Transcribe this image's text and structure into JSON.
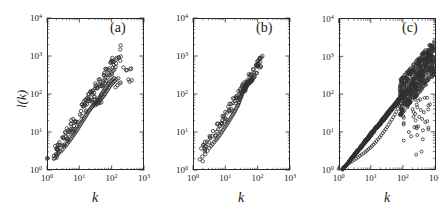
{
  "figure": {
    "background_color": "#ffffff",
    "marker_color": "#303030",
    "axis_color": "#2b2b2b",
    "width": 439,
    "height": 219
  },
  "panels": [
    {
      "label": "(a)",
      "xlabel": "k",
      "ylabel": "l(k)"
    },
    {
      "label": "(b)",
      "xlabel": "k",
      "ylabel": ""
    },
    {
      "label": "(c)",
      "xlabel": "k",
      "ylabel": ""
    }
  ],
  "ticks": {
    "x": [
      "10",
      "10",
      "10",
      "10"
    ],
    "x_exp": [
      "0",
      "1",
      "2",
      "3"
    ],
    "y": [
      "10",
      "10",
      "10",
      "10",
      "10"
    ],
    "y_exp": [
      "0",
      "1",
      "2",
      "3",
      "4"
    ]
  },
  "chart_data": [
    {
      "type": "scatter",
      "title": "(a)",
      "xlabel": "k",
      "ylabel": "l(k)",
      "xscale": "log",
      "yscale": "log",
      "xlim": [
        1,
        1000
      ],
      "ylim": [
        1,
        10000
      ],
      "xticks": [
        1,
        10,
        100,
        1000
      ],
      "yticks": [
        1,
        10,
        100,
        1000,
        10000
      ],
      "grid": false,
      "legend": "none",
      "marker": "open-circle",
      "points": [
        [
          1.0,
          2.0
        ],
        [
          1.05,
          2.05
        ],
        [
          2.0,
          2.4
        ],
        [
          2.3,
          2.8
        ],
        [
          2.7,
          3.1
        ],
        [
          3.0,
          3.4
        ],
        [
          3.4,
          3.9
        ],
        [
          3.8,
          4.3
        ],
        [
          4.2,
          4.8
        ],
        [
          4.6,
          5.4
        ],
        [
          5.0,
          5.9
        ],
        [
          5.5,
          6.6
        ],
        [
          6.0,
          7.3
        ],
        [
          6.5,
          8.1
        ],
        [
          7.0,
          8.9
        ],
        [
          7.6,
          9.8
        ],
        [
          8.2,
          10.8
        ],
        [
          8.8,
          11.9
        ],
        [
          9.5,
          13.2
        ],
        [
          10.2,
          14.6
        ],
        [
          11.0,
          16.0
        ],
        [
          11.8,
          17.6
        ],
        [
          12.6,
          19.3
        ],
        [
          13.5,
          21.2
        ],
        [
          14.4,
          23.0
        ],
        [
          15.4,
          25.4
        ],
        [
          16.4,
          27.8
        ],
        [
          17.5,
          30.2
        ],
        [
          18.6,
          33.0
        ],
        [
          19.8,
          36.0
        ],
        [
          21.0,
          38.0
        ],
        [
          22.3,
          41.0
        ],
        [
          23.6,
          44.0
        ],
        [
          25.0,
          47.0
        ],
        [
          26.5,
          50.0
        ],
        [
          28.0,
          53.0
        ],
        [
          29.6,
          56.0
        ],
        [
          31.0,
          50.0
        ],
        [
          32.0,
          58.0
        ],
        [
          33.0,
          62.0
        ],
        [
          34.0,
          54.0
        ],
        [
          35.0,
          66.0
        ],
        [
          36.0,
          60.0
        ],
        [
          37.0,
          70.0
        ],
        [
          38.0,
          56.0
        ],
        [
          39.0,
          74.0
        ],
        [
          40.0,
          63.0
        ],
        [
          41.0,
          78.0
        ],
        [
          42.0,
          58.0
        ],
        [
          43.0,
          82.0
        ],
        [
          44.0,
          68.0
        ],
        [
          45.0,
          88.0
        ],
        [
          46.0,
          72.0
        ],
        [
          47.0,
          95.0
        ],
        [
          48.0,
          60.0
        ],
        [
          49.0,
          100.0
        ],
        [
          50.0,
          78.0
        ],
        [
          52.0,
          110.0
        ],
        [
          54.0,
          85.0
        ],
        [
          56.0,
          120.0
        ],
        [
          58.0,
          92.0
        ],
        [
          60.0,
          130.0
        ],
        [
          62.0,
          100.0
        ],
        [
          64.0,
          140.0
        ],
        [
          66.0,
          110.0
        ],
        [
          68.0,
          155.0
        ],
        [
          70.0,
          120.0
        ],
        [
          73.0,
          170.0
        ],
        [
          76.0,
          130.0
        ],
        [
          79.0,
          185.0
        ],
        [
          82.0,
          145.0
        ],
        [
          85.0,
          200.0
        ],
        [
          88.0,
          160.0
        ],
        [
          92.0,
          215.0
        ],
        [
          96.0,
          175.0
        ],
        [
          100.0,
          230.0
        ],
        [
          105.0,
          190.0
        ],
        [
          110.0,
          250.0
        ],
        [
          115.0,
          205.0
        ],
        [
          120.0,
          265.0
        ],
        [
          126.0,
          220.0
        ],
        [
          132.0,
          150.0
        ],
        [
          140.0,
          240.0
        ],
        [
          150.0,
          170.0
        ],
        [
          160.0,
          260.0
        ],
        [
          175.0,
          190.0
        ],
        [
          190.0,
          200.0
        ],
        [
          230.0,
          500.0
        ],
        [
          280.0,
          420.0
        ],
        [
          300.0,
          430.0
        ],
        [
          330.0,
          240.0
        ],
        [
          360.0,
          210.0
        ],
        [
          380.0,
          450.0
        ],
        [
          400.0,
          470.0
        ],
        [
          420.0,
          230.0
        ]
      ]
    },
    {
      "type": "scatter",
      "title": "(b)",
      "xlabel": "k",
      "ylabel": "",
      "xscale": "log",
      "yscale": "log",
      "xlim": [
        1,
        1000
      ],
      "ylim": [
        1,
        10000
      ],
      "xticks": [
        1,
        10,
        100,
        1000
      ],
      "yticks": [
        1,
        10,
        100,
        1000,
        10000
      ],
      "grid": false,
      "legend": "none",
      "marker": "open-circle",
      "points": [
        [
          2.0,
          1.7
        ],
        [
          2.4,
          2.6
        ],
        [
          2.8,
          3.2
        ],
        [
          3.2,
          3.8
        ],
        [
          3.6,
          4.3
        ],
        [
          4.0,
          4.8
        ],
        [
          4.5,
          5.4
        ],
        [
          5.0,
          6.0
        ],
        [
          5.5,
          6.6
        ],
        [
          6.0,
          7.3
        ],
        [
          6.6,
          8.2
        ],
        [
          7.2,
          9.1
        ],
        [
          7.8,
          10.0
        ],
        [
          8.5,
          11.2
        ],
        [
          9.2,
          12.4
        ],
        [
          10.0,
          13.8
        ],
        [
          10.8,
          15.2
        ],
        [
          11.6,
          16.8
        ],
        [
          12.5,
          18.5
        ],
        [
          13.4,
          20.5
        ],
        [
          14.4,
          22.5
        ],
        [
          15.4,
          25.0
        ],
        [
          16.5,
          27.5
        ],
        [
          17.6,
          30.0
        ],
        [
          18.8,
          33.0
        ],
        [
          20.0,
          36.0
        ],
        [
          21.2,
          40.0
        ],
        [
          22.5,
          44.0
        ],
        [
          23.8,
          48.0
        ],
        [
          25.0,
          52.0
        ],
        [
          26.0,
          58.0
        ],
        [
          27.0,
          62.0
        ],
        [
          28.0,
          68.0
        ],
        [
          29.0,
          74.0
        ],
        [
          30.0,
          80.0
        ],
        [
          31.0,
          86.0
        ],
        [
          32.0,
          92.0
        ],
        [
          33.0,
          100.0
        ],
        [
          34.0,
          108.0
        ],
        [
          35.0,
          116.0
        ],
        [
          36.0,
          124.0
        ],
        [
          37.0,
          132.0
        ],
        [
          38.0,
          140.0
        ],
        [
          39.0,
          150.0
        ],
        [
          40.0,
          160.0
        ],
        [
          41.0,
          130.0
        ],
        [
          42.0,
          170.0
        ],
        [
          43.0,
          145.0
        ],
        [
          44.0,
          180.0
        ],
        [
          45.0,
          155.0
        ],
        [
          46.0,
          190.0
        ],
        [
          47.0,
          165.0
        ],
        [
          48.0,
          200.0
        ],
        [
          49.0,
          175.0
        ],
        [
          50.0,
          210.0
        ],
        [
          52.0,
          185.0
        ],
        [
          54.0,
          220.0
        ],
        [
          56.0,
          195.0
        ],
        [
          58.0,
          235.0
        ],
        [
          60.0,
          205.0
        ],
        [
          62.0,
          245.0
        ],
        [
          64.0,
          215.0
        ],
        [
          66.0,
          255.0
        ],
        [
          68.0,
          225.0
        ],
        [
          70.0,
          265.0
        ],
        [
          75.0,
          270.0
        ],
        [
          80.0,
          280.0
        ],
        [
          90.0,
          560.0
        ],
        [
          100.0,
          600.0
        ],
        [
          105.0,
          640.0
        ],
        [
          120.0,
          700.0
        ],
        [
          140.0,
          1000.0
        ]
      ]
    },
    {
      "type": "scatter",
      "title": "(c)",
      "xlabel": "k",
      "ylabel": "",
      "xscale": "log",
      "yscale": "log",
      "xlim": [
        1,
        1000
      ],
      "ylim": [
        1,
        10000
      ],
      "xticks": [
        1,
        10,
        100,
        1000
      ],
      "yticks": [
        1,
        10,
        100,
        1000,
        10000
      ],
      "grid": false,
      "legend": "none",
      "marker": "open-circle",
      "description": "Dense trunk rising from (1,1) with a broad fan-shaped cloud above k=100 and sparse low outliers",
      "points": [
        [
          1.0,
          1.05
        ],
        [
          1.4,
          1.15
        ],
        [
          1.8,
          1.3
        ],
        [
          2.2,
          1.5
        ],
        [
          2.6,
          1.65
        ],
        [
          3.0,
          1.8
        ],
        [
          3.5,
          1.95
        ],
        [
          4.0,
          2.1
        ],
        [
          4.6,
          2.3
        ],
        [
          5.2,
          2.5
        ],
        [
          6.0,
          2.7
        ],
        [
          6.8,
          2.95
        ],
        [
          7.6,
          3.2
        ],
        [
          8.6,
          3.5
        ],
        [
          9.6,
          3.8
        ],
        [
          10.8,
          4.2
        ],
        [
          12.0,
          4.6
        ],
        [
          13.5,
          5.1
        ],
        [
          15.0,
          5.7
        ],
        [
          17.0,
          6.4
        ],
        [
          19.0,
          7.2
        ],
        [
          21.0,
          8.1
        ],
        [
          23.5,
          9.2
        ],
        [
          26.0,
          10.4
        ],
        [
          29.0,
          11.8
        ],
        [
          32.0,
          13.4
        ],
        [
          36.0,
          15.5
        ],
        [
          40.0,
          18.0
        ],
        [
          45.0,
          21.0
        ],
        [
          50.0,
          24.5
        ],
        [
          56.0,
          29.0
        ],
        [
          62.0,
          34.0
        ],
        [
          70.0,
          41.0
        ],
        [
          78.0,
          48.0
        ],
        [
          86.0,
          56.0
        ],
        [
          95.0,
          66.0
        ],
        [
          105.0,
          78.0
        ],
        [
          115.0,
          90.0
        ],
        [
          125.0,
          100.0
        ],
        [
          135.0,
          115.0
        ],
        [
          148.0,
          130.0
        ],
        [
          160.0,
          148.0
        ],
        [
          175.0,
          165.0
        ],
        [
          190.0,
          185.0
        ],
        [
          205.0,
          205.0
        ],
        [
          220.0,
          230.0
        ],
        [
          240.0,
          255.0
        ],
        [
          260.0,
          280.0
        ],
        [
          280.0,
          310.0
        ],
        [
          300.0,
          340.0
        ],
        [
          330.0,
          380.0
        ],
        [
          360.0,
          420.0
        ],
        [
          400.0,
          470.0
        ],
        [
          440.0,
          520.0
        ],
        [
          480.0,
          570.0
        ],
        [
          530.0,
          630.0
        ],
        [
          580.0,
          680.0
        ],
        [
          640.0,
          740.0
        ],
        [
          700.0,
          800.0
        ],
        [
          150.0,
          70.0
        ],
        [
          170.0,
          95.0
        ],
        [
          185.0,
          120.0
        ],
        [
          200.0,
          300.0
        ],
        [
          215.0,
          420.0
        ],
        [
          230.0,
          150.0
        ],
        [
          250.0,
          550.0
        ],
        [
          270.0,
          95.0
        ],
        [
          290.0,
          640.0
        ],
        [
          310.0,
          190.0
        ],
        [
          340.0,
          700.0
        ],
        [
          370.0,
          250.0
        ],
        [
          410.0,
          820.0
        ],
        [
          450.0,
          330.0
        ],
        [
          500.0,
          900.0
        ],
        [
          550.0,
          400.0
        ],
        [
          620.0,
          1000.0
        ],
        [
          680.0,
          480.0
        ],
        [
          760.0,
          1100.0
        ],
        [
          830.0,
          600.0
        ],
        [
          200.0,
          40.0
        ],
        [
          240.0,
          30.0
        ],
        [
          280.0,
          45.0
        ],
        [
          320.0,
          25.0
        ],
        [
          360.0,
          38.0
        ],
        [
          400.0,
          22.0
        ],
        [
          450.0,
          33.0
        ],
        [
          500.0,
          18.0
        ],
        [
          300.0,
          14.0
        ],
        [
          420.0,
          11.0
        ],
        [
          260.0,
          2.5
        ],
        [
          380.0,
          3.0
        ]
      ]
    }
  ]
}
